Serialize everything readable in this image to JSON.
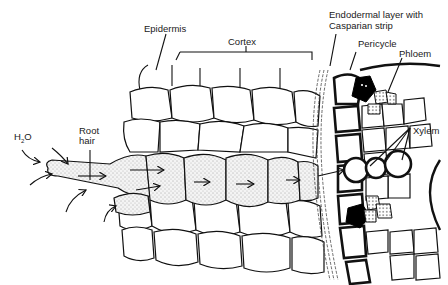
{
  "diagram": {
    "labels": {
      "water": "H",
      "water_sub": "2",
      "water_end": "O",
      "root_hair_line1": "Root",
      "root_hair_line2": "hair",
      "epidermis": "Epidermis",
      "cortex": "Cortex",
      "endodermis_line1": "Endodermal layer with",
      "endodermis_line2": "Casparian strip",
      "pericycle": "Pericycle",
      "phloem": "Phloem",
      "xylem": "Xylem"
    },
    "colors": {
      "ink": "#111111",
      "background": "#ffffff",
      "phloem_companion": "#000000"
    }
  }
}
